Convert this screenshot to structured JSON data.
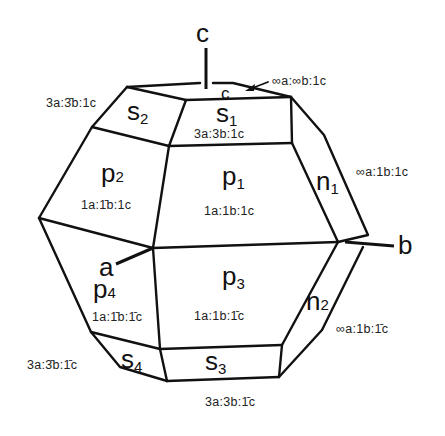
{
  "diagram": {
    "axes": {
      "c": "c",
      "b": "b",
      "a": "a"
    },
    "small_face": {
      "label": "c",
      "index": "∞a:∞b:1c"
    },
    "faces": {
      "s1": {
        "label": "s",
        "sub": "1",
        "index": "3a:3b:1c"
      },
      "s2": {
        "label": "s",
        "sub": "2",
        "index": "3a:3̄b:1c"
      },
      "s3": {
        "label": "s",
        "sub": "3",
        "index": "3a:3b:1̄c"
      },
      "s4": {
        "label": "s",
        "sub": "4",
        "index": "3a:3̄b:1̄c"
      },
      "p1": {
        "label": "p",
        "sub": "1",
        "index": "1a:1b:1c"
      },
      "p2": {
        "label": "p",
        "sub": "2",
        "index": "1a:1̄b:1c"
      },
      "p3": {
        "label": "p",
        "sub": "3",
        "index": "1a:1b:1̄c"
      },
      "p4": {
        "label": "p",
        "sub": "4",
        "index": "1a:1̄b:1̄c"
      },
      "n1": {
        "label": "n",
        "sub": "1",
        "index": "∞a:1b:1c"
      },
      "n2": {
        "label": "n",
        "sub": "2",
        "index": "∞a:1b:1̄c"
      }
    },
    "colors": {
      "line": "#111111",
      "background": "#ffffff"
    }
  }
}
